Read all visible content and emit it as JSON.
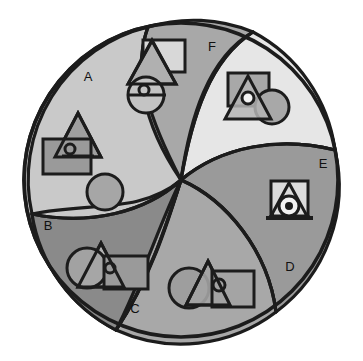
{
  "figure": {
    "kind": "region-diagram",
    "background": "#ffffff",
    "outline_color": "#1c1c1c",
    "circle": {
      "cx": 181,
      "cy": 180,
      "r": 157
    }
  },
  "palette": {
    "very_light": "#e6e6e6",
    "light": "#c9c9c9",
    "mid_light": "#bdbdbd",
    "mid": "#a8a8a8",
    "mid_dark": "#9a9a9a",
    "dark": "#8a8a8a",
    "darker": "#7e7e7e",
    "outline": "#1c1c1c",
    "white": "#f2f2f2"
  },
  "regions": [
    {
      "id": "A",
      "label": "A",
      "label_x": 88,
      "label_y": 78,
      "fill": "#c9c9c9",
      "position": "upper-left"
    },
    {
      "id": "B",
      "label": "B",
      "label_x": 48,
      "label_y": 227,
      "fill": "#8a8a8a",
      "position": "lower-left"
    },
    {
      "id": "C",
      "label": "C",
      "label_x": 135,
      "label_y": 310,
      "fill": "#a8a8a8",
      "position": "bottom-center"
    },
    {
      "id": "D",
      "label": "D",
      "label_x": 290,
      "label_y": 268,
      "fill": "#a8a8a8",
      "position": "lower-right"
    },
    {
      "id": "E",
      "label": "E",
      "label_x": 323,
      "label_y": 165,
      "fill": "#9a9a9a",
      "position": "right"
    },
    {
      "id": "F",
      "label": "F",
      "label_x": 212,
      "label_y": 48,
      "fill": "#a8a8a8",
      "position": "top-center"
    }
  ],
  "light_lobe": {
    "id": "light-lobe",
    "fill": "#e6e6e6",
    "position": "upper-right"
  },
  "shape_clusters": [
    {
      "name": "cluster-top-center",
      "region": "F",
      "shapes": [
        {
          "type": "rectangle",
          "fill": "#d8d8d8",
          "x": 143,
          "y": 40,
          "w": 42,
          "h": 32,
          "stroke_w": 3
        },
        {
          "type": "triangle",
          "fill": "#b0b0b0",
          "cx": 152,
          "cy": 62,
          "w": 48,
          "h": 44,
          "stroke_w": 3
        },
        {
          "type": "circle",
          "fill": "#c4c4c4",
          "cx": 146,
          "cy": 95,
          "r": 18,
          "stroke_w": 3
        },
        {
          "type": "line",
          "x1": 130,
          "y1": 98,
          "x2": 166,
          "y2": 98,
          "stroke_w": 3
        },
        {
          "type": "circle",
          "fill": "none",
          "cx": 145,
          "cy": 92,
          "r": 5,
          "stroke_w": 3
        }
      ]
    },
    {
      "name": "cluster-left-middle",
      "region": "A",
      "shapes": [
        {
          "type": "triangle",
          "fill": "#9f9f9f",
          "cx": 78,
          "cy": 135,
          "w": 46,
          "h": 44,
          "stroke_w": 3
        },
        {
          "type": "rectangle",
          "fill": "#9a9a9a",
          "x": 43,
          "y": 139,
          "w": 48,
          "h": 35,
          "stroke_w": 3
        },
        {
          "type": "line",
          "x1": 63,
          "y1": 155,
          "x2": 93,
          "y2": 155,
          "stroke_w": 3
        },
        {
          "type": "circle",
          "fill": "none",
          "cx": 70,
          "cy": 149,
          "r": 5,
          "stroke_w": 3
        }
      ]
    },
    {
      "name": "cluster-plain-circle",
      "region": "A",
      "shapes": [
        {
          "type": "circle",
          "fill": "#a6a6a6",
          "cx": 105,
          "cy": 192,
          "r": 18,
          "stroke_w": 3
        }
      ]
    },
    {
      "name": "cluster-upper-right",
      "region": "light-lobe",
      "shapes": [
        {
          "type": "rectangle",
          "fill": "#a8a8a8",
          "x": 228,
          "y": 73,
          "w": 41,
          "h": 33,
          "stroke_w": 3
        },
        {
          "type": "circle",
          "fill": "#a8a8a8",
          "cx": 273,
          "cy": 108,
          "r": 17,
          "stroke_w": 3
        },
        {
          "type": "triangle",
          "fill": "#b4b4b4",
          "cx": 248,
          "cy": 98,
          "w": 46,
          "h": 42,
          "stroke_w": 3
        },
        {
          "type": "circle",
          "fill": "#f2f2f2",
          "cx": 248,
          "cy": 98,
          "r": 6,
          "stroke_w": 3
        }
      ]
    },
    {
      "name": "cluster-right",
      "region": "E",
      "shapes": [
        {
          "type": "rectangle",
          "fill": "#dcdcdc",
          "x": 271,
          "y": 181,
          "w": 37,
          "h": 35,
          "stroke_w": 3
        },
        {
          "type": "triangle",
          "fill": "#dcdcdc",
          "cx": 289,
          "cy": 199,
          "w": 38,
          "h": 36,
          "stroke_w": 3
        },
        {
          "type": "circle",
          "fill": "#f2f2f2",
          "cx": 289,
          "cy": 206,
          "r": 10,
          "stroke_w": 3
        },
        {
          "type": "circle",
          "fill": "#1c1c1c",
          "cx": 289,
          "cy": 206,
          "r": 4,
          "stroke_w": 2
        },
        {
          "type": "line",
          "x1": 266,
          "y1": 218,
          "x2": 313,
          "y2": 218,
          "stroke_w": 3
        }
      ]
    },
    {
      "name": "cluster-bottom-left",
      "region": "B",
      "shapes": [
        {
          "type": "triangle",
          "fill": "#b2b2b2",
          "cx": 101,
          "cy": 265,
          "w": 46,
          "h": 44,
          "stroke_w": 3
        },
        {
          "type": "circle",
          "fill": "#a4a4a4",
          "cx": 87,
          "cy": 268,
          "r": 20,
          "stroke_w": 3
        },
        {
          "type": "rectangle",
          "fill": "#9a9a9a",
          "x": 104,
          "y": 256,
          "w": 44,
          "h": 33,
          "stroke_w": 3
        },
        {
          "type": "circle",
          "fill": "none",
          "cx": 110,
          "cy": 268,
          "r": 5,
          "stroke_w": 3
        }
      ]
    },
    {
      "name": "cluster-bottom-center",
      "region": "C",
      "shapes": [
        {
          "type": "circle",
          "fill": "#9e9e9e",
          "cx": 189,
          "cy": 288,
          "r": 20,
          "stroke_w": 3
        },
        {
          "type": "triangle",
          "fill": "#a3a3a3",
          "cx": 208,
          "cy": 283,
          "w": 44,
          "h": 44,
          "stroke_w": 3
        },
        {
          "type": "rectangle",
          "fill": "#a3a3a3",
          "x": 212,
          "y": 271,
          "w": 42,
          "h": 36,
          "stroke_w": 3
        },
        {
          "type": "circle",
          "fill": "none",
          "cx": 219,
          "cy": 285,
          "r": 6,
          "stroke_w": 3
        }
      ]
    }
  ]
}
